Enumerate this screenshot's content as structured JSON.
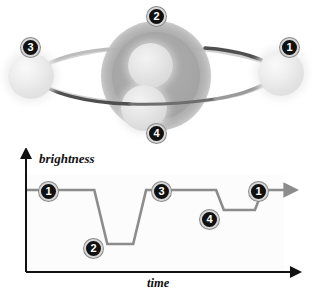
{
  "diagram": {
    "scene": {
      "star": {
        "name": "star",
        "color": "#a6a6a6",
        "glow_color": "#d7d7d7"
      },
      "planets": [
        {
          "id": "planet-right",
          "position_label": "1",
          "state": "in-front-right"
        },
        {
          "id": "planet-top",
          "position_label": "2",
          "state": "transiting-near"
        },
        {
          "id": "planet-left",
          "position_label": "3",
          "state": "in-front-left"
        },
        {
          "id": "planet-bottom",
          "position_label": "4",
          "state": "transiting-far"
        }
      ],
      "orbit": {
        "front_color": "#4a4a4a",
        "back_color": "#cfcfcf"
      },
      "badges": [
        {
          "label": "1",
          "x": 280,
          "y": 38
        },
        {
          "label": "2",
          "x": 147,
          "y": 7
        },
        {
          "label": "3",
          "x": 21,
          "y": 38
        },
        {
          "label": "4",
          "x": 147,
          "y": 124
        }
      ]
    }
  },
  "chart_data": {
    "type": "line",
    "title": "",
    "xlabel": "time",
    "ylabel": "brightness",
    "grid": false,
    "legend": "none",
    "xlim": [
      0,
      100
    ],
    "ylim": [
      0,
      100
    ],
    "axis_arrows": true,
    "series": [
      {
        "name": "brightness",
        "color": "#8c8c8c",
        "x": [
          0,
          26,
          31,
          31,
          41,
          41,
          46,
          71,
          73,
          76,
          86,
          88,
          91,
          100
        ],
        "y": [
          82,
          82,
          28,
          28,
          28,
          28,
          82,
          82,
          82,
          62,
          62,
          62,
          82,
          82
        ]
      }
    ],
    "baseline_level": 82,
    "deep_transit_level": 28,
    "shallow_transit_level": 62,
    "annotations": [
      {
        "label": "1",
        "x": 12,
        "y": 66,
        "note": "planet beside star - full brightness"
      },
      {
        "label": "2",
        "x": 32,
        "y": 14,
        "note": "large planet transits - deep dip"
      },
      {
        "label": "3",
        "x": 58,
        "y": 66,
        "note": "planet behind star - full brightness"
      },
      {
        "label": "4",
        "x": 80,
        "y": 40,
        "note": "small planet transits - shallow dip"
      },
      {
        "label": "1",
        "x": 93,
        "y": 66,
        "note": "back to full brightness"
      }
    ]
  }
}
